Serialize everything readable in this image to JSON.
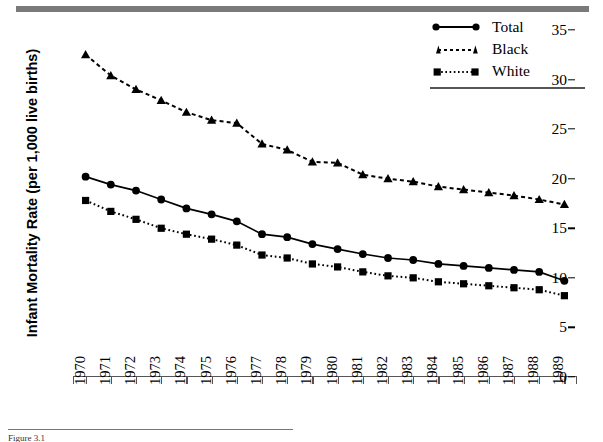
{
  "figure": {
    "caption": "Figure 3.1",
    "top_rule_color": "#7a7a7a"
  },
  "axes": {
    "y_title": "Infant Mortality Rate (per 1,000 live births)",
    "y_ticks": [
      "0",
      "5",
      "10",
      "15",
      "20",
      "25",
      "30",
      "35"
    ],
    "x_ticks": [
      "1970",
      "1971",
      "1972",
      "1973",
      "1974",
      "1975",
      "1976",
      "1977",
      "1978",
      "1979",
      "1980",
      "1981",
      "1982",
      "1983",
      "1984",
      "1985",
      "1986",
      "1987",
      "1988",
      "1989"
    ]
  },
  "legend": {
    "position": "top-right",
    "items": [
      {
        "label": "Total",
        "marker": "circle-marker",
        "line": "solid"
      },
      {
        "label": "Black",
        "marker": "triangle-marker",
        "line": "dashed"
      },
      {
        "label": "White",
        "marker": "square-marker",
        "line": "dotted"
      }
    ]
  },
  "chart_data": {
    "type": "line",
    "title": "",
    "xlabel": "",
    "ylabel": "Infant Mortality Rate (per 1,000 live births)",
    "ylim": [
      0,
      36
    ],
    "grid": false,
    "legend_position": "top-right",
    "x": [
      1970,
      1971,
      1972,
      1973,
      1974,
      1975,
      1976,
      1977,
      1978,
      1979,
      1980,
      1981,
      1982,
      1983,
      1984,
      1985,
      1986,
      1987,
      1988,
      1989
    ],
    "categories": [
      "1970",
      "1971",
      "1972",
      "1973",
      "1974",
      "1975",
      "1976",
      "1977",
      "1978",
      "1979",
      "1980",
      "1981",
      "1982",
      "1983",
      "1984",
      "1985",
      "1986",
      "1987",
      "1988",
      "1989"
    ],
    "series": [
      {
        "name": "Total",
        "marker": "circle",
        "linestyle": "solid",
        "color": "#000000",
        "values": [
          20.2,
          19.4,
          18.8,
          17.9,
          17.0,
          16.4,
          15.7,
          14.4,
          14.1,
          13.4,
          12.9,
          12.4,
          12.0,
          11.8,
          11.4,
          11.2,
          11.0,
          10.8,
          10.6,
          9.7
        ]
      },
      {
        "name": "Black",
        "marker": "triangle",
        "linestyle": "dashed",
        "color": "#000000",
        "values": [
          32.5,
          30.4,
          29.0,
          27.9,
          26.7,
          25.9,
          25.6,
          23.5,
          22.9,
          21.7,
          21.6,
          20.4,
          20.0,
          19.7,
          19.2,
          18.9,
          18.6,
          18.3,
          17.9,
          17.4
        ]
      },
      {
        "name": "White",
        "marker": "square",
        "linestyle": "dotted",
        "color": "#000000",
        "values": [
          17.8,
          16.7,
          15.9,
          15.0,
          14.4,
          13.9,
          13.3,
          12.3,
          12.0,
          11.4,
          11.1,
          10.6,
          10.2,
          10.0,
          9.6,
          9.4,
          9.2,
          9.0,
          8.8,
          8.2
        ]
      }
    ]
  }
}
